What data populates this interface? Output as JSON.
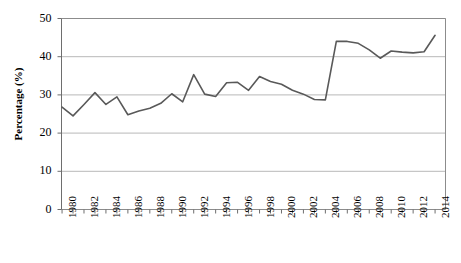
{
  "chart_data": {
    "type": "line",
    "title": "",
    "xlabel": "",
    "ylabel": "Percentage (%)",
    "ylim": [
      0,
      50
    ],
    "ytick_values": [
      0,
      10,
      20,
      30,
      40,
      50
    ],
    "ytick_labels": [
      "0",
      "10",
      "20",
      "30",
      "40",
      "50"
    ],
    "grid": "horizontal",
    "legend": "none",
    "line_color": "#595959",
    "x": [
      1980,
      1981,
      1982,
      1983,
      1984,
      1985,
      1986,
      1987,
      1988,
      1989,
      1990,
      1991,
      1992,
      1993,
      1994,
      1995,
      1996,
      1997,
      1998,
      1999,
      2000,
      2001,
      2002,
      2003,
      2004,
      2005,
      2006,
      2007,
      2008,
      2009,
      2010,
      2011,
      2012,
      2013,
      2014
    ],
    "xtick_labels": [
      "1980",
      "1982",
      "1984",
      "1986",
      "1988",
      "1990",
      "1992",
      "1994",
      "1996",
      "1998",
      "2000",
      "2002",
      "2004",
      "2006",
      "2008",
      "2010",
      "2012",
      "2014"
    ],
    "xtick_label_years": [
      1980,
      1982,
      1984,
      1986,
      1988,
      1990,
      1992,
      1994,
      1996,
      1998,
      2000,
      2002,
      2004,
      2006,
      2008,
      2010,
      2012,
      2014
    ],
    "values": [
      26.8,
      24.5,
      27.5,
      30.6,
      27.5,
      29.5,
      24.8,
      25.8,
      26.5,
      27.8,
      30.3,
      28.2,
      35.3,
      30.2,
      29.6,
      33.2,
      33.3,
      31.2,
      34.8,
      33.5,
      32.8,
      31.2,
      30.2,
      28.8,
      28.7,
      44.0,
      44.0,
      43.5,
      41.8,
      39.6,
      41.5,
      41.2,
      41.0,
      41.3,
      45.6
    ]
  }
}
